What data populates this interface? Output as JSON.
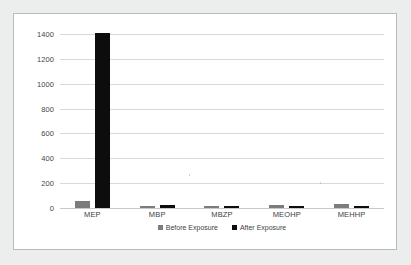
{
  "chart_data": {
    "type": "bar",
    "title": "",
    "xlabel": "",
    "ylabel": "",
    "categories": [
      "MEP",
      "MBP",
      "MBZP",
      "MEOHP",
      "MEHHP"
    ],
    "series": [
      {
        "name": "Before Exposure",
        "color": "#7c7c7c",
        "values": [
          60,
          20,
          16,
          24,
          30
        ]
      },
      {
        "name": "After Exposure",
        "color": "#0d0d0d",
        "values": [
          1410,
          22,
          20,
          18,
          20
        ]
      }
    ],
    "ylim": [
      0,
      1400
    ],
    "yticks": [
      0,
      200,
      400,
      600,
      800,
      1000,
      1200,
      1400
    ],
    "ytick_labels": [
      "0",
      "200",
      "400",
      "600",
      "800",
      "1000",
      "1200",
      "1400"
    ],
    "grid": true,
    "legend_position": "bottom"
  },
  "legend": {
    "items": [
      {
        "label": "Before Exposure"
      },
      {
        "label": "After Exposure"
      }
    ]
  },
  "colors": {
    "before": "#7c7c7c",
    "after": "#0d0d0d",
    "grid": "#d9d9d9",
    "frame": "#b9bbbd",
    "page_background": "#eceded",
    "plot_background": "#ffffff"
  }
}
